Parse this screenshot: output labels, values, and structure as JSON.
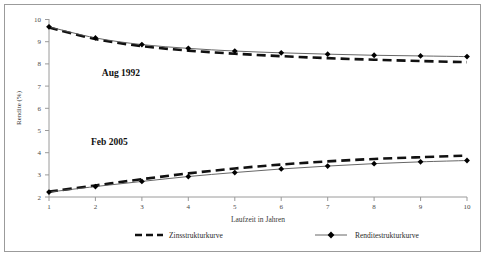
{
  "chart_data": {
    "type": "line",
    "title": "",
    "xlabel": "Laufzeit in Jahren",
    "ylabel": "Rendite (%)",
    "x": [
      1,
      2,
      3,
      4,
      5,
      6,
      7,
      8,
      9,
      10
    ],
    "xlim": [
      1,
      10
    ],
    "ylim": [
      2,
      10
    ],
    "xticks": [
      "1",
      "2",
      "3",
      "4",
      "5",
      "6",
      "7",
      "8",
      "9",
      "10"
    ],
    "yticks": [
      "2",
      "3",
      "4",
      "5",
      "6",
      "7",
      "8",
      "9",
      "10"
    ],
    "grid": false,
    "legend_position": "bottom",
    "series": [
      {
        "name": "Zinsstrukturkurve",
        "group": "Aug 1992",
        "style": "dashed",
        "markers": false,
        "values": [
          9.62,
          9.1,
          8.78,
          8.58,
          8.44,
          8.33,
          8.24,
          8.17,
          8.11,
          8.06
        ]
      },
      {
        "name": "Renditestrukturkurve",
        "group": "Aug 1992",
        "style": "thin-line-with-diamonds",
        "markers": true,
        "values": [
          9.65,
          9.15,
          8.85,
          8.68,
          8.56,
          8.48,
          8.42,
          8.37,
          8.34,
          8.31
        ]
      },
      {
        "name": "Zinsstrukturkurve",
        "group": "Feb 2005",
        "style": "dashed",
        "markers": false,
        "values": [
          2.24,
          2.52,
          2.8,
          3.06,
          3.28,
          3.46,
          3.6,
          3.71,
          3.79,
          3.86
        ]
      },
      {
        "name": "Renditestrukturkurve",
        "group": "Feb 2005",
        "style": "thin-line-with-diamonds",
        "markers": true,
        "values": [
          2.22,
          2.47,
          2.7,
          2.92,
          3.1,
          3.26,
          3.39,
          3.5,
          3.58,
          3.64
        ]
      }
    ],
    "annotations": [
      {
        "text": "Aug 1992",
        "x": 2.55,
        "y": 7.45
      },
      {
        "text": "Feb 2005",
        "x": 2.3,
        "y": 4.35
      }
    ],
    "legend": [
      {
        "label": "Zinsstrukturkurve",
        "style": "dashed",
        "marker": "none"
      },
      {
        "label": "Renditestrukturkurve",
        "style": "thin",
        "marker": "diamond"
      }
    ],
    "colors": {
      "dashed_series": "#111111",
      "thin_series": "#555555",
      "marker": "#000000",
      "axis": "#9a9a9a",
      "frame": "#9b9b9b",
      "background": "#ffffff"
    }
  }
}
